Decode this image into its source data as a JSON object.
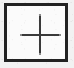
{
  "canvas": {
    "width": 74,
    "height": 68,
    "background_color": "#f2f2f2",
    "appearance": "scanned low-resolution bitmap with speckle noise"
  },
  "button": {
    "name": "add-button",
    "label": "",
    "accessible_label": "Add",
    "shape": "square",
    "border_color": "#222222",
    "border_width_px": 3,
    "fill_color": "#fbfbfb",
    "bounds": {
      "x": 4,
      "y": 3,
      "width": 64,
      "height": 59
    }
  },
  "icon": {
    "name": "plus-icon",
    "glyph": "+",
    "semantic": "add",
    "color": "#3a3a3a",
    "stroke_width_px": 2,
    "horizontal_arm": {
      "x1": 19,
      "x2": 56,
      "y": 34
    },
    "vertical_arm": {
      "y1": 16,
      "y2": 52,
      "x": 37
    },
    "end_cap_color": "#8a8a8a"
  }
}
